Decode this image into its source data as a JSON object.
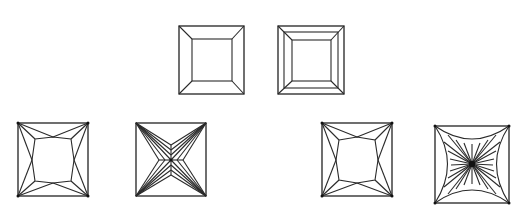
{
  "figure": {
    "stroke_color": "#2a2a2a",
    "background": "#ffffff",
    "diagrams": [
      {
        "id": "d1",
        "name": "square-step-cut-single",
        "row": 1,
        "box": [
          179,
          26,
          244,
          94
        ]
      },
      {
        "id": "d2",
        "name": "square-step-cut-double",
        "row": 1,
        "box": [
          278,
          26,
          344,
          94
        ]
      },
      {
        "id": "d3",
        "name": "princess-cut-top-a",
        "row": 2,
        "box": [
          18,
          123,
          88,
          196
        ]
      },
      {
        "id": "d4",
        "name": "princess-cut-pavilion-x",
        "row": 2,
        "box": [
          136,
          123,
          206,
          196
        ]
      },
      {
        "id": "d5",
        "name": "princess-cut-top-b",
        "row": 2,
        "box": [
          322,
          123,
          392,
          196
        ]
      },
      {
        "id": "d6",
        "name": "radiant-star-pavilion",
        "row": 2,
        "box": [
          435,
          126,
          509,
          203
        ]
      }
    ]
  }
}
